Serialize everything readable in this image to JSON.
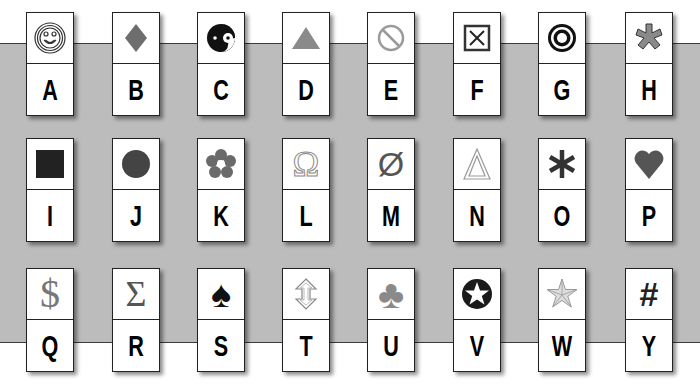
{
  "colors": {
    "band": "#bcbcbc",
    "line": "#3a3a3a",
    "symbol_gray": "#7a7a7a",
    "symbol_dark": "#1a1a1a"
  },
  "rows": [
    {
      "cards": [
        {
          "letter": "A",
          "symbol": "smiley-icon"
        },
        {
          "letter": "B",
          "symbol": "diamond-icon"
        },
        {
          "letter": "C",
          "symbol": "yin-yang-icon"
        },
        {
          "letter": "D",
          "symbol": "triangle-icon"
        },
        {
          "letter": "E",
          "symbol": "prohibited-icon"
        },
        {
          "letter": "F",
          "symbol": "boxed-x-icon"
        },
        {
          "letter": "G",
          "symbol": "bullseye-icon"
        },
        {
          "letter": "H",
          "symbol": "asterisk-star-icon"
        }
      ]
    },
    {
      "cards": [
        {
          "letter": "I",
          "symbol": "square-icon"
        },
        {
          "letter": "J",
          "symbol": "circle-icon"
        },
        {
          "letter": "K",
          "symbol": "flower-icon"
        },
        {
          "letter": "L",
          "symbol": "omega-icon",
          "glyph": "Ω"
        },
        {
          "letter": "M",
          "symbol": "empty-set-icon",
          "glyph": "Ø"
        },
        {
          "letter": "N",
          "symbol": "delta-outline-icon"
        },
        {
          "letter": "O",
          "symbol": "asterisk-icon",
          "glyph": "✱"
        },
        {
          "letter": "P",
          "symbol": "heart-icon",
          "glyph": "♥"
        }
      ]
    },
    {
      "cards": [
        {
          "letter": "Q",
          "symbol": "dollar-icon",
          "glyph": "$"
        },
        {
          "letter": "R",
          "symbol": "sigma-icon",
          "glyph": "Σ"
        },
        {
          "letter": "S",
          "symbol": "spade-icon",
          "glyph": "♠"
        },
        {
          "letter": "T",
          "symbol": "up-down-arrow-icon"
        },
        {
          "letter": "U",
          "symbol": "club-icon",
          "glyph": "♣"
        },
        {
          "letter": "V",
          "symbol": "star-in-circle-icon"
        },
        {
          "letter": "W",
          "symbol": "nautical-star-icon"
        },
        {
          "letter": "Y",
          "symbol": "hash-icon",
          "glyph": "#"
        }
      ]
    }
  ]
}
